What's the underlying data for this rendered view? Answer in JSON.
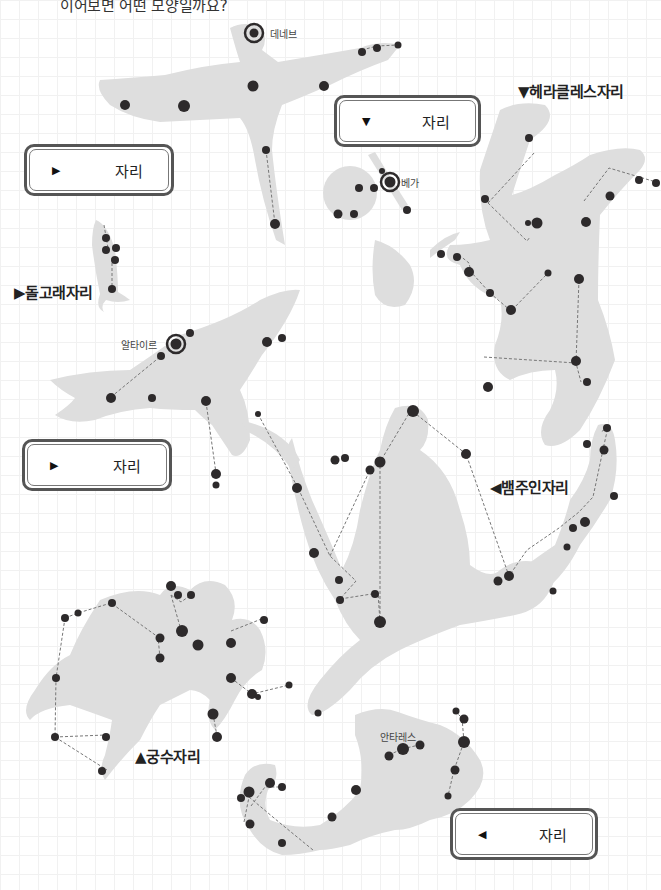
{
  "title": "이어보면 어떤 모양일까요?",
  "colors": {
    "silhouette": "#dedede",
    "star": "#2d2a2b",
    "line": "#777777",
    "grid": "#f1f1f1",
    "box_border": "#555555"
  },
  "answer_boxes": [
    {
      "id": "box-swan",
      "arrow": "▶",
      "suffix": "자리",
      "value": ""
    },
    {
      "id": "box-lyra",
      "arrow": "▼",
      "suffix": "자리",
      "value": ""
    },
    {
      "id": "box-eagle",
      "arrow": "▶",
      "suffix": "자리",
      "value": ""
    },
    {
      "id": "box-scorpion",
      "arrow": "◀",
      "suffix": "자리",
      "value": ""
    }
  ],
  "constellation_labels": {
    "hercules": "▼헤라클레스자리",
    "dolphin": "▶돌고래자리",
    "ophiuchus": "◀뱀주인자리",
    "sagittarius": "▲궁수자리"
  },
  "star_labels": {
    "deneb": "데네브",
    "vega": "베가",
    "altair": "알타이르",
    "antares": "안타레스"
  }
}
